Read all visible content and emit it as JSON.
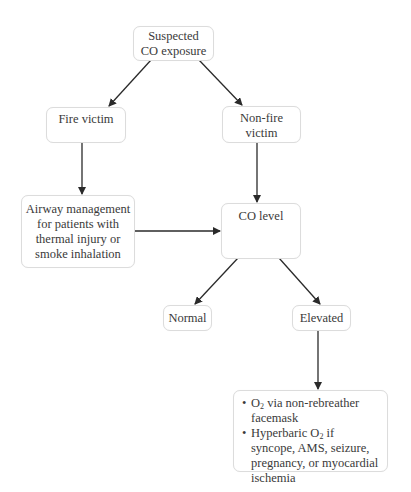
{
  "diagram": {
    "type": "flowchart",
    "nodes": {
      "start": {
        "lines": [
          "Suspected",
          "CO exposure"
        ]
      },
      "fire": {
        "lines": [
          "Fire victim"
        ]
      },
      "nonfire": {
        "lines": [
          "Non-fire",
          "victim"
        ]
      },
      "airway": {
        "lines": [
          "Airway management",
          "for patients with",
          "thermal injury or",
          "smoke inhalation"
        ]
      },
      "colevel": {
        "lines": [
          "CO level"
        ]
      },
      "normal": {
        "lines": [
          "Normal"
        ]
      },
      "elevated": {
        "lines": [
          "Elevated"
        ]
      },
      "treatment": {
        "items": [
          {
            "prefix": "O",
            "sub": "2",
            "suffix": " via non-rebreather facemask"
          },
          {
            "prefix": "Hyperbaric O",
            "sub": "2",
            "suffix": " if syncope, AMS, seizure, pregnancy, or myocardial ischemia"
          }
        ]
      }
    },
    "edges": [
      {
        "from": "Suspected CO exposure",
        "to": "Fire victim"
      },
      {
        "from": "Suspected CO exposure",
        "to": "Non-fire victim"
      },
      {
        "from": "Fire victim",
        "to": "Airway management for patients with thermal injury or smoke inhalation"
      },
      {
        "from": "Non-fire victim",
        "to": "CO level"
      },
      {
        "from": "Airway management for patients with thermal injury or smoke inhalation",
        "to": "CO level"
      },
      {
        "from": "CO level",
        "to": "Normal"
      },
      {
        "from": "CO level",
        "to": "Elevated"
      },
      {
        "from": "Elevated",
        "to": "O2 via non-rebreather facemask / Hyperbaric O2"
      }
    ],
    "colors": {
      "box_border": "#dcdcdc",
      "arrow": "#2a2a2a",
      "text": "#3a3a3a"
    }
  }
}
